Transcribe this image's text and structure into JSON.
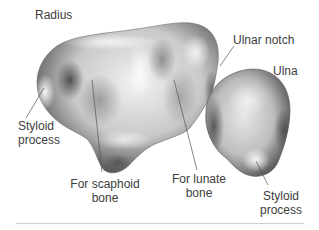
{
  "figure": {
    "labels": {
      "radius": "Radius",
      "ulnar_notch": "Ulnar notch",
      "ulna": "Ulna",
      "styloid_radius_line1": "Styloid",
      "styloid_radius_line2": "process",
      "scaphoid_line1": "For scaphoid",
      "scaphoid_line2": "bone",
      "lunate_line1": "For lunate",
      "lunate_line2": "bone",
      "styloid_ulna_line1": "Styloid",
      "styloid_ulna_line2": "process"
    },
    "colors": {
      "background": "#ffffff",
      "text": "#3d3d3d",
      "leader_line": "#555555",
      "divider": "#cfcfcf",
      "bone_light": "#f4f4f4",
      "bone_mid": "#b8b8b8",
      "bone_dark": "#4a4a4a"
    }
  }
}
